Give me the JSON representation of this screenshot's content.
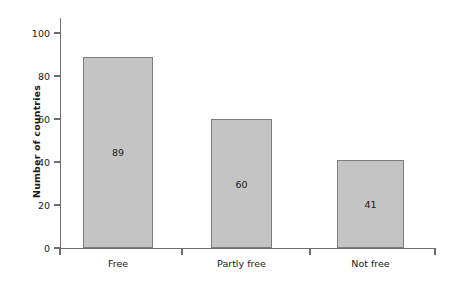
{
  "chart_data": {
    "type": "bar",
    "title": "",
    "subtitle": "",
    "xlabel": "",
    "ylabel": "Number of countries",
    "categories": [
      "Free",
      "Partly free",
      "Not free"
    ],
    "values": [
      89,
      60,
      41
    ],
    "data_labels": [
      "89",
      "60",
      "41"
    ],
    "data_label_position": "inside-center",
    "ylim": [
      0,
      100
    ],
    "y_ticks": [
      0,
      20,
      40,
      60,
      80,
      100
    ],
    "y_tick_labels": [
      "0",
      "20",
      "40",
      "60",
      "80",
      "100"
    ],
    "grid": false,
    "legend": false,
    "legend_position": "none",
    "bar_fill_color": "#c4c4c4",
    "bar_border_color": "#7d7d7d",
    "axis_color": "#6e6e6e",
    "text_color": "#1a1a1a",
    "background_color": "#ffffff"
  }
}
